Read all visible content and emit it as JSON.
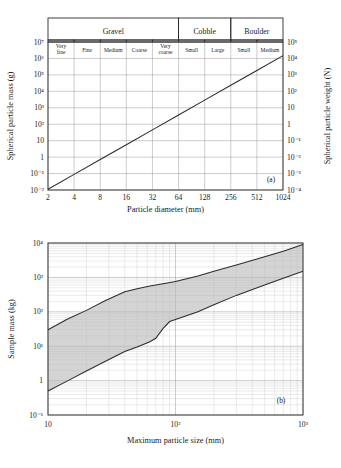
{
  "figure": {
    "panel_a_label": "(a)",
    "panel_b_label": "(b)"
  },
  "classification": {
    "groups": [
      {
        "name": "Gravel",
        "span": 5
      },
      {
        "name": "Cobble",
        "span": 2
      },
      {
        "name": "Boulder",
        "span": 2
      }
    ],
    "subclasses": [
      "Very fine",
      "Fine",
      "Medium",
      "Coarse",
      "Very coarse",
      "Small",
      "Large",
      "Small",
      "Medium"
    ]
  },
  "chart_data": [
    {
      "type": "line",
      "id": "panel-a",
      "title": "",
      "panel": "(a)",
      "xlabel": "Particle diameter (mm)",
      "ylabel": "Spherical particle mass (g)",
      "y2label": "Spherical particle weight (N)",
      "xscale": "log",
      "yscale": "log",
      "xlim": [
        2,
        1024
      ],
      "ylim": [
        0.01,
        10000000
      ],
      "y2lim": [
        0.0001,
        100000
      ],
      "xticklabels": [
        "2",
        "4",
        "8",
        "16",
        "32",
        "64",
        "128",
        "256",
        "512",
        "1024"
      ],
      "xtickvalues": [
        2,
        4,
        8,
        16,
        32,
        64,
        128,
        256,
        512,
        1024
      ],
      "yticklabels": [
        "10⁻²",
        "10⁻¹",
        "1",
        "10",
        "10²",
        "10³",
        "10⁴",
        "10⁵",
        "10⁶",
        "10⁷"
      ],
      "ytickvalues": [
        0.01,
        0.1,
        1,
        10,
        100,
        1000,
        10000,
        100000,
        1000000,
        10000000
      ],
      "y2ticklabels": [
        "10⁻⁴",
        "10⁻³",
        "10⁻²",
        "10⁻¹",
        "1",
        "10",
        "10²",
        "10³",
        "10⁴",
        "10⁵"
      ],
      "y2tickvalues": [
        0.0001,
        0.001,
        0.01,
        0.1,
        1,
        10,
        100,
        1000,
        10000,
        100000
      ],
      "grid": true,
      "legend": "none",
      "series": [
        {
          "name": "Spherical particle mass",
          "x": [
            2,
            4,
            8,
            16,
            32,
            64,
            128,
            256,
            512,
            1024
          ],
          "y": [
            0.0111,
            0.0888,
            0.71,
            5.68,
            45.5,
            364,
            2910,
            23300,
            186000,
            1490000
          ]
        }
      ]
    },
    {
      "type": "area",
      "id": "panel-b",
      "title": "",
      "panel": "(b)",
      "xlabel": "Maximum particle size (mm)",
      "ylabel": "Sample mass (kg)",
      "xscale": "log",
      "yscale": "log",
      "xlim": [
        10,
        1000
      ],
      "ylim": [
        0.1,
        10000
      ],
      "xticklabels": [
        "10",
        "10²",
        "10³"
      ],
      "xtickvalues": [
        10,
        100,
        1000
      ],
      "yticklabels": [
        "10⁻¹",
        "1",
        "10¹",
        "10²",
        "10³",
        "10⁴"
      ],
      "ytickvalues": [
        0.1,
        1,
        10,
        100,
        1000,
        10000
      ],
      "grid": true,
      "legend": "none",
      "series": [
        {
          "name": "Upper bound",
          "x": [
            10,
            14,
            20,
            28,
            40,
            50,
            63,
            80,
            100,
            150,
            200,
            300,
            500,
            700,
            1000
          ],
          "y": [
            30,
            60,
            110,
            210,
            380,
            470,
            560,
            650,
            760,
            1100,
            1500,
            2300,
            4000,
            5800,
            9000
          ]
        },
        {
          "name": "Lower bound",
          "x": [
            10,
            14,
            20,
            28,
            40,
            50,
            63,
            70,
            80,
            90,
            100,
            150,
            200,
            300,
            500,
            700,
            1000
          ],
          "y": [
            0.5,
            0.95,
            1.9,
            3.6,
            7.0,
            9.5,
            13.5,
            17,
            33,
            52,
            60,
            100,
            160,
            300,
            600,
            950,
            1500
          ]
        }
      ]
    }
  ]
}
